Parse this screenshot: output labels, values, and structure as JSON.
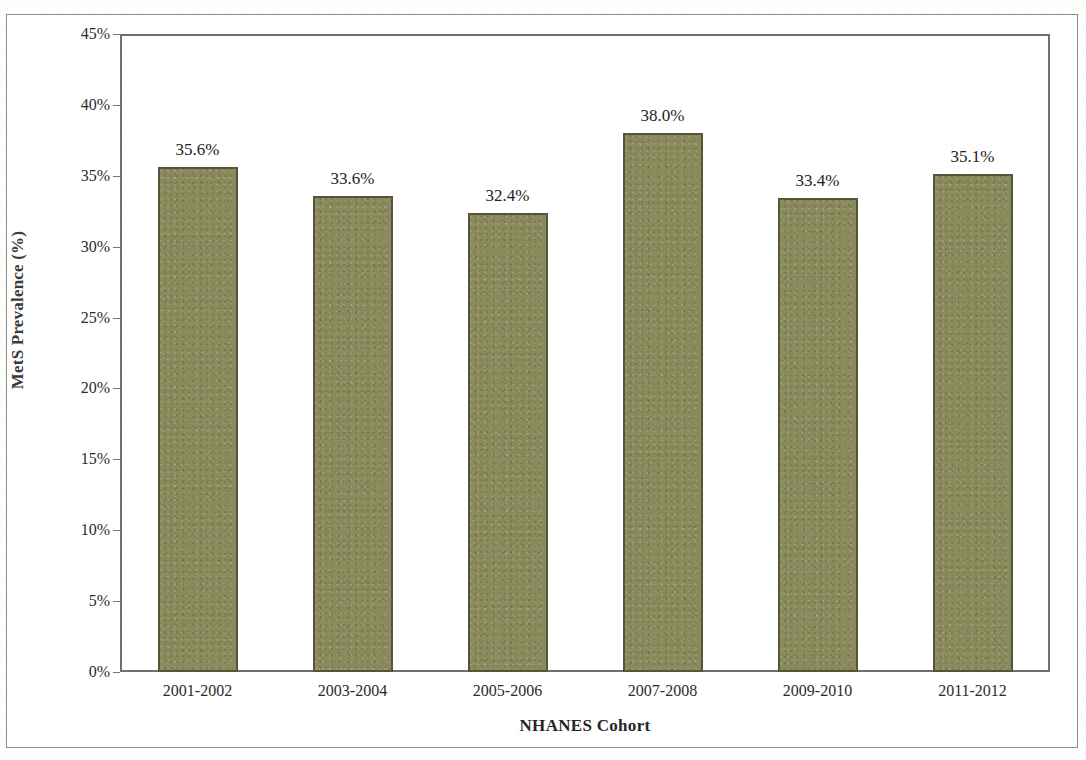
{
  "chart_data": {
    "type": "bar",
    "title": "",
    "xlabel": "NHANES Cohort",
    "ylabel": "MetS Prevalence (%)",
    "categories": [
      "2001-2002",
      "2003-2004",
      "2005-2006",
      "2007-2008",
      "2009-2010",
      "2011-2012"
    ],
    "values": [
      35.6,
      33.6,
      32.4,
      38.0,
      33.4,
      35.1
    ],
    "value_labels": [
      "35.6%",
      "33.6%",
      "32.4%",
      "38.0%",
      "33.4%",
      "35.1%"
    ],
    "ylim": [
      0,
      45
    ],
    "ytick_values": [
      0,
      5,
      10,
      15,
      20,
      25,
      30,
      35,
      40,
      45
    ],
    "ytick_labels": [
      "0%",
      "5%",
      "10%",
      "15%",
      "20%",
      "25%",
      "30%",
      "35%",
      "40%",
      "45%"
    ],
    "grid": false,
    "legend": null,
    "bar_color": "#8a8a5c",
    "bar_border_color": "#55553a",
    "plot_background": "#ffffff",
    "axis_color": "#6f6f6f"
  }
}
